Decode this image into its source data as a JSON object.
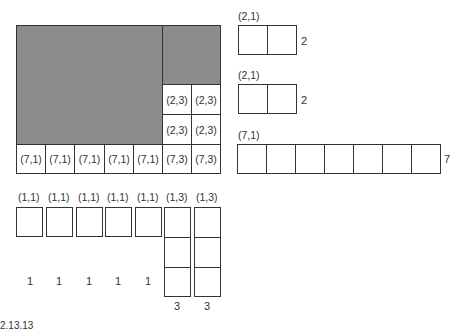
{
  "main_grid": {
    "row_label_a": "(2,3)",
    "row_label_b": "(2,3)",
    "bottom_row": [
      "(7,1)",
      "(7,1)",
      "(7,1)",
      "(7,1)",
      "(7,1)",
      "(7,3)",
      "(7,3)"
    ],
    "mid_cells": [
      "(2,3)",
      "(2,3)",
      "(2,3)",
      "(2,3)"
    ]
  },
  "right_blocks": [
    {
      "label": "(2,1)",
      "count": 2,
      "side": "2"
    },
    {
      "label": "(2,1)",
      "count": 2,
      "side": "2"
    },
    {
      "label": "(7,1)",
      "count": 7,
      "side": "7"
    }
  ],
  "bottom_blocks": {
    "labels": [
      "(1,1)",
      "(1,1)",
      "(1,1)",
      "(1,1)",
      "(1,1)",
      "(1,3)",
      "(1,3)"
    ],
    "under": [
      "1",
      "1",
      "1",
      "1",
      "1",
      "3",
      "3"
    ]
  },
  "footer_fragment": "2.13.13"
}
